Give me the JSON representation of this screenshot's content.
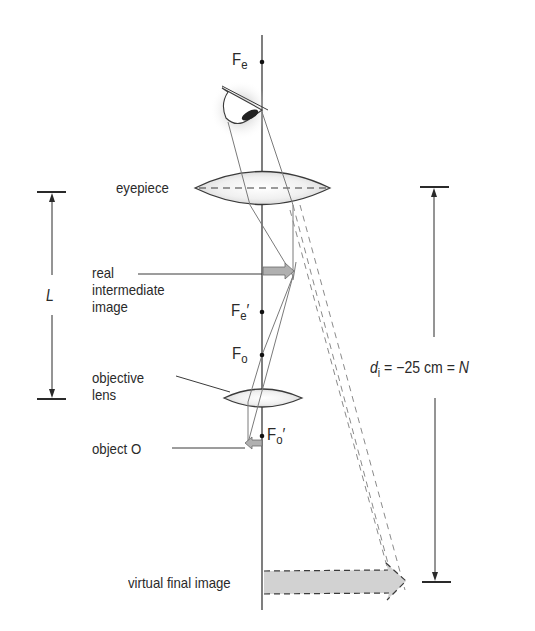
{
  "diagram": {
    "labels": {
      "eyepiece": "eyepiece",
      "real_intermediate_image": [
        "real",
        "intermediate",
        "image"
      ],
      "objective_lens": [
        "objective",
        "lens"
      ],
      "object": "object O",
      "virtual_final_image": "virtual final image"
    },
    "focal_points": {
      "Fe": {
        "main": "F",
        "sub": "e",
        "prime": ""
      },
      "Fe_prime": {
        "main": "F",
        "sub": "e",
        "prime": "′"
      },
      "Fo": {
        "main": "F",
        "sub": "o",
        "prime": ""
      },
      "Fo_prime": {
        "main": "F",
        "sub": "o",
        "prime": "′"
      }
    },
    "dimensions": {
      "tube_length": "L",
      "image_distance": {
        "symbol": "d",
        "subscript": "i",
        "equation": " = −25 cm = ",
        "result": "N"
      }
    },
    "colors": {
      "line": "#3a3a3a",
      "ray": "#777777",
      "lens_fill": "#e4e4e4",
      "arrow_fill": "#b8b8b8",
      "virtual_image_fill": "#d2d2d2",
      "text": "#2a2a2a"
    }
  }
}
